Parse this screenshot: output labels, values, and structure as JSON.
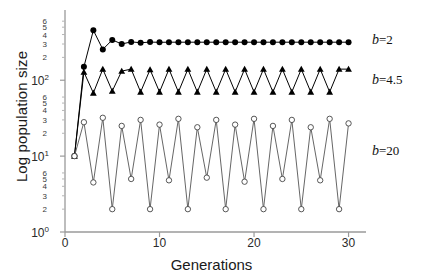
{
  "chart_data": {
    "type": "line",
    "title": "",
    "subtitle": "",
    "xlabel": "Generations",
    "ylabel": "Log population size",
    "xlim": [
      0,
      31
    ],
    "ylim_log10": [
      0,
      2.82
    ],
    "yscale": "log",
    "xticks": [
      0,
      10,
      20,
      30
    ],
    "xtick_labels": [
      "0",
      "10",
      "20",
      "30"
    ],
    "ytick_major": [
      1,
      10,
      100
    ],
    "ytick_major_labels": [
      "10⁰",
      "10¹",
      "10²"
    ],
    "ytick_minor": [
      2,
      3,
      4,
      5,
      6,
      20,
      30,
      40,
      50,
      60,
      200,
      300,
      400,
      500,
      600
    ],
    "ytick_minor_labels": [
      "2",
      "3",
      "4",
      "5",
      "6",
      "2",
      "3",
      "4",
      "5",
      "6",
      "2",
      "3",
      "4",
      "5",
      "6"
    ],
    "grid": false,
    "legend_position": "right-inline",
    "annotations": [
      {
        "text": "b=2",
        "series": "b=2"
      },
      {
        "text": "b=4.5",
        "series": "b=4.5"
      },
      {
        "text": "b=20",
        "series": "b=20"
      }
    ],
    "x": [
      1,
      2,
      3,
      4,
      5,
      6,
      7,
      8,
      9,
      10,
      11,
      12,
      13,
      14,
      15,
      16,
      17,
      18,
      19,
      20,
      21,
      22,
      23,
      24,
      25,
      26,
      27,
      28,
      29,
      30
    ],
    "series": [
      {
        "name": "b=2",
        "marker": "filled-circle",
        "color": "#000000",
        "values": [
          10,
          150,
          455,
          255,
          340,
          300,
          320,
          312,
          318,
          316,
          317,
          317,
          317,
          317,
          317,
          317,
          317,
          317,
          317,
          317,
          317,
          317,
          317,
          317,
          317,
          317,
          317,
          317,
          317,
          317
        ]
      },
      {
        "name": "b=4.5",
        "marker": "filled-triangle",
        "color": "#000000",
        "values": [
          10,
          128,
          68,
          140,
          72,
          132,
          140,
          70,
          138,
          70,
          140,
          70,
          140,
          70,
          140,
          70,
          140,
          70,
          140,
          70,
          140,
          70,
          140,
          70,
          140,
          70,
          140,
          70,
          140,
          140
        ]
      },
      {
        "name": "b=20",
        "marker": "open-circle",
        "color": "#555555",
        "values": [
          10,
          28,
          4.5,
          32,
          2,
          25,
          5,
          30,
          2,
          26,
          4.8,
          31,
          2,
          24,
          5.2,
          30,
          2,
          26,
          4.6,
          31,
          2,
          25,
          5,
          30,
          2,
          24,
          4.8,
          31,
          2,
          27
        ]
      }
    ]
  },
  "axes": {
    "xlabel": "Generations",
    "ylabel": "Log population size"
  }
}
